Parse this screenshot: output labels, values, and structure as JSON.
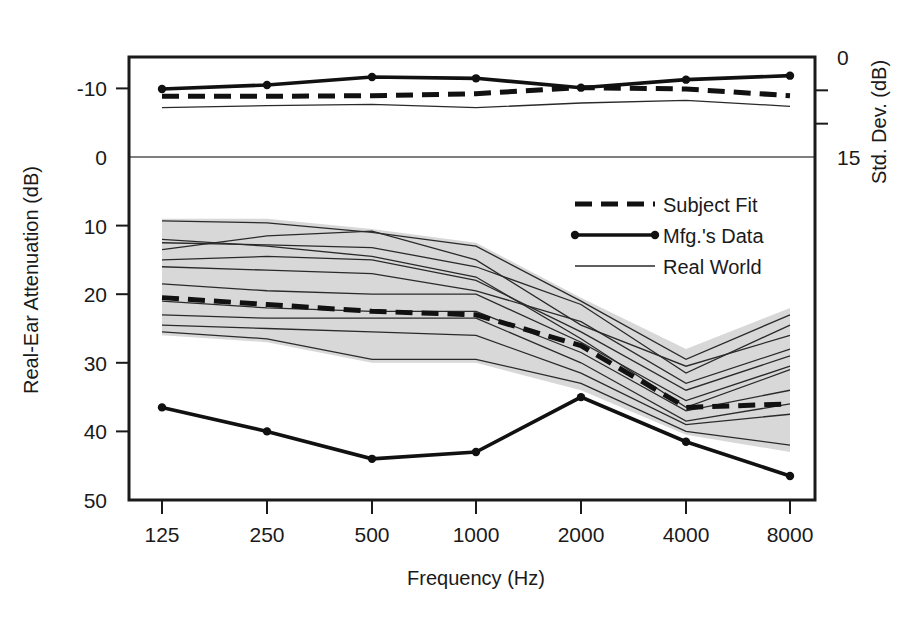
{
  "chart_data": {
    "type": "line",
    "title": "",
    "xlabel": "Frequency (Hz)",
    "ylabel": "Real-Ear Attenuation (dB)",
    "y2label": "Std. Dev. (dB)",
    "categories": [
      "125",
      "250",
      "500",
      "1000",
      "2000",
      "4000",
      "8000"
    ],
    "x": [
      125,
      250,
      500,
      1000,
      2000,
      4000,
      8000
    ],
    "xticklabels": [
      "125",
      "250",
      "500",
      "1000",
      "2000",
      "4000",
      "8000"
    ],
    "yticks": [
      -10,
      0,
      10,
      20,
      30,
      40,
      50
    ],
    "yticklabels": [
      "-10",
      "0",
      "10",
      "20",
      "30",
      "40",
      "50"
    ],
    "ylim": [
      -15,
      50
    ],
    "y_inverted": true,
    "y2ticks": [
      0,
      5,
      10,
      15
    ],
    "y2ticklabels": [
      "0",
      "",
      "",
      "15"
    ],
    "y2lim": [
      0,
      15
    ],
    "grid": false,
    "zero_gridline": 0,
    "legend_position": "center-right",
    "legend": [
      {
        "name": "Subject Fit",
        "style": "dashed-thick"
      },
      {
        "name": "Mfg.'s Data",
        "style": "solid-thick-markers"
      },
      {
        "name": "Real World",
        "style": "solid-thin"
      }
    ],
    "panels": [
      {
        "name": "attenuation",
        "note": "Lower panel: Real-Ear Attenuation in dB, axis inverted (0 at top, 50 at bottom)",
        "series": [
          {
            "name": "Mfg.'s Data",
            "style": "solid-thick-markers",
            "values": [
              36.5,
              40.0,
              44.0,
              43.0,
              35.0,
              41.5,
              46.5
            ]
          },
          {
            "name": "Subject Fit",
            "style": "dashed-thick",
            "values": [
              20.5,
              21.5,
              22.5,
              23.0,
              27.5,
              36.5,
              36.0
            ]
          },
          {
            "name": "Real World band upper",
            "style": "band",
            "values": [
              9.0,
              9.0,
              10.5,
              12.5,
              20.5,
              28.0,
              22.0
            ]
          },
          {
            "name": "Real World band lower",
            "style": "band",
            "values": [
              26.0,
              27.0,
              30.0,
              30.0,
              34.0,
              40.5,
              43.0
            ]
          }
        ],
        "real_world_lines": [
          {
            "values": [
              9.3,
              9.6,
              11.0,
              13.0,
              21.0,
              29.5,
              23.0
            ]
          },
          {
            "values": [
              12.5,
              12.8,
              13.2,
              16.0,
              21.5,
              31.5,
              24.5
            ]
          },
          {
            "values": [
              13.5,
              11.5,
              10.8,
              15.0,
              24.5,
              30.5,
              26.0
            ]
          },
          {
            "values": [
              15.0,
              14.5,
              15.0,
              18.0,
              25.5,
              34.0,
              29.0
            ]
          },
          {
            "values": [
              16.0,
              16.5,
              17.0,
              19.5,
              24.0,
              33.0,
              28.0
            ]
          },
          {
            "values": [
              12.0,
              13.0,
              14.5,
              17.5,
              26.5,
              36.5,
              31.0
            ]
          },
          {
            "values": [
              18.5,
              19.5,
              20.0,
              20.0,
              27.0,
              35.5,
              30.5
            ]
          },
          {
            "values": [
              21.0,
              22.0,
              22.5,
              22.5,
              28.5,
              37.0,
              34.0
            ]
          },
          {
            "values": [
              23.0,
              23.5,
              23.5,
              23.5,
              30.0,
              38.5,
              36.0
            ]
          },
          {
            "values": [
              24.5,
              25.0,
              25.5,
              26.0,
              31.5,
              39.0,
              37.5
            ]
          },
          {
            "values": [
              25.5,
              26.5,
              29.5,
              29.5,
              33.0,
              40.0,
              42.0
            ]
          }
        ]
      },
      {
        "name": "std_dev",
        "note": "Upper panel: Standard deviation in dB, 0 at top of frame, 15 at the zero line of the attenuation axis",
        "series": [
          {
            "name": "Mfg.'s Data",
            "style": "solid-thick-markers",
            "values": [
              4.8,
              4.2,
              3.0,
              3.2,
              4.6,
              3.4,
              2.8
            ]
          },
          {
            "name": "Subject Fit",
            "style": "dashed-thick",
            "values": [
              5.9,
              5.9,
              5.8,
              5.5,
              4.6,
              4.8,
              5.8
            ]
          },
          {
            "name": "Real World",
            "style": "solid-thin",
            "values": [
              7.6,
              7.3,
              7.1,
              7.6,
              6.9,
              6.5,
              7.4
            ]
          }
        ]
      }
    ]
  },
  "axes": {
    "left_title": "Real-Ear Attenuation (dB)",
    "right_title": "Std. Dev. (dB)",
    "bottom_title": "Frequency (Hz)"
  }
}
